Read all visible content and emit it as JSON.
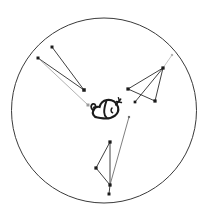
{
  "figure": {
    "title": "",
    "background_color": "#ffffff",
    "width": 213,
    "height": 220
  },
  "boundary": {
    "label": "circle-boundary",
    "shape": "circle",
    "center": {
      "x": 104,
      "y": 110.5
    },
    "radius": 92.5,
    "stroke_color": "#3a3a3a",
    "stroke_width": 1.0,
    "fill": "none"
  },
  "center_glyph": {
    "label": "central-calligraphic-glyph",
    "description": "stylized dark calligraphic creature mark",
    "position": {
      "x": 104,
      "y": 110
    },
    "color": "#1b1b1b"
  },
  "chart_data": {
    "type": "scatter",
    "title": "",
    "xlabel": "",
    "ylabel": "",
    "xlim": [
      0,
      213
    ],
    "ylim": [
      0,
      220
    ],
    "grid": false,
    "legend_position": "none",
    "clusters": [
      {
        "name": "upper-left-cluster",
        "color": "#1b1b1b",
        "points": [
          {
            "id": "ul-a",
            "x": 52,
            "y": 47,
            "color": "#1b1b1b",
            "size": 2.2
          },
          {
            "id": "ul-b",
            "x": 38,
            "y": 58,
            "color": "#1b1b1b",
            "size": 2.2
          },
          {
            "id": "ul-c",
            "x": 84,
            "y": 90,
            "color": "#1b1b1b",
            "size": 2.6
          },
          {
            "id": "ul-d",
            "x": 88,
            "y": 105,
            "color": "#9a9a9a",
            "size": 2.2
          }
        ],
        "edges": [
          {
            "from": "ul-a",
            "to": "ul-c",
            "color": "#2a2a2a",
            "width": 0.9
          },
          {
            "from": "ul-b",
            "to": "ul-c",
            "color": "#2a2a2a",
            "width": 0.9
          },
          {
            "from": "ul-b",
            "to": "ul-d",
            "color": "#a8a8a8",
            "width": 0.9
          }
        ]
      },
      {
        "name": "right-cluster",
        "color": "#1b1b1b",
        "points": [
          {
            "id": "r-a",
            "x": 163,
            "y": 68,
            "color": "#1b1b1b",
            "size": 2.4
          },
          {
            "id": "r-b",
            "x": 128,
            "y": 89,
            "color": "#1b1b1b",
            "size": 2.4
          },
          {
            "id": "r-c",
            "x": 155,
            "y": 101,
            "color": "#1b1b1b",
            "size": 2.4
          },
          {
            "id": "r-d",
            "x": 135,
            "y": 102,
            "color": "#1b1b1b",
            "size": 2.0
          },
          {
            "id": "r-e",
            "x": 172,
            "y": 55,
            "color": "#b5b5b5",
            "size": 1.6
          }
        ],
        "edges": [
          {
            "from": "r-b",
            "to": "r-a",
            "color": "#2a2a2a",
            "width": 0.9
          },
          {
            "from": "r-a",
            "to": "r-c",
            "color": "#2a2a2a",
            "width": 0.9
          },
          {
            "from": "r-c",
            "to": "r-b",
            "color": "#2a2a2a",
            "width": 0.9
          },
          {
            "from": "r-a",
            "to": "r-d",
            "color": "#2a2a2a",
            "width": 0.9
          },
          {
            "from": "r-a",
            "to": "r-e",
            "color": "#bdbdbd",
            "width": 0.9
          }
        ]
      },
      {
        "name": "lower-cluster",
        "color": "#1b1b1b",
        "points": [
          {
            "id": "l-a",
            "x": 110,
            "y": 142,
            "color": "#1b1b1b",
            "size": 2.4
          },
          {
            "id": "l-b",
            "x": 96,
            "y": 168,
            "color": "#1b1b1b",
            "size": 2.4
          },
          {
            "id": "l-c",
            "x": 110,
            "y": 185,
            "color": "#1b1b1b",
            "size": 2.4
          },
          {
            "id": "l-d",
            "x": 109,
            "y": 194,
            "color": "#1b1b1b",
            "size": 2.2
          },
          {
            "id": "l-e",
            "x": 129,
            "y": 117,
            "color": "#6f6f6f",
            "size": 1.6
          }
        ],
        "edges": [
          {
            "from": "l-a",
            "to": "l-b",
            "color": "#2a2a2a",
            "width": 0.9
          },
          {
            "from": "l-b",
            "to": "l-c",
            "color": "#2a2a2a",
            "width": 0.9
          },
          {
            "from": "l-a",
            "to": "l-c",
            "color": "#2a2a2a",
            "width": 0.9
          },
          {
            "from": "l-c",
            "to": "l-d",
            "color": "#2a2a2a",
            "width": 0.9
          },
          {
            "from": "l-c",
            "to": "l-e",
            "color": "#6f6f6f",
            "width": 0.9
          }
        ]
      }
    ]
  }
}
